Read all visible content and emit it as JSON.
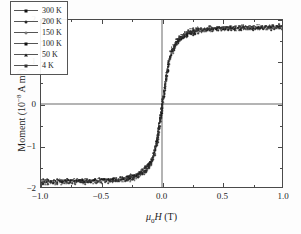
{
  "chart_data": {
    "type": "scatter",
    "title": "",
    "xlabel": "μ₀H (T)",
    "ylabel": "Moment (10⁻⁸ A m²)",
    "xlim": [
      -1.0,
      1.0
    ],
    "ylim": [
      -2.0,
      2.0
    ],
    "xticks": [
      "-1.0",
      "-0.5",
      "0.0",
      "0.5",
      "1.0"
    ],
    "xtick_values": [
      -1.0,
      -0.5,
      0.0,
      0.5,
      1.0
    ],
    "yticks": [
      "2",
      "1",
      "0",
      "-1",
      "-2"
    ],
    "ytick_values": [
      2,
      1,
      0,
      -1,
      -2
    ],
    "grid": false,
    "zero_lines": true,
    "legend_position": "upper-left",
    "x": [
      -1.0,
      -0.95,
      -0.9,
      -0.85,
      -0.8,
      -0.75,
      -0.7,
      -0.65,
      -0.6,
      -0.55,
      -0.5,
      -0.45,
      -0.4,
      -0.35,
      -0.3,
      -0.27,
      -0.24,
      -0.21,
      -0.18,
      -0.15,
      -0.13,
      -0.11,
      -0.09,
      -0.07,
      -0.05,
      -0.04,
      -0.03,
      -0.02,
      -0.01,
      0.0,
      0.01,
      0.02,
      0.03,
      0.04,
      0.05,
      0.07,
      0.09,
      0.11,
      0.13,
      0.15,
      0.18,
      0.21,
      0.24,
      0.27,
      0.3,
      0.35,
      0.4,
      0.45,
      0.5,
      0.55,
      0.6,
      0.65,
      0.7,
      0.75,
      0.8,
      0.85,
      0.9,
      0.95,
      1.0
    ],
    "series": [
      {
        "name": "300 K",
        "marker": "square",
        "color": "#111111",
        "values": [
          -1.8,
          -1.8,
          -1.8,
          -1.8,
          -1.8,
          -1.79,
          -1.79,
          -1.79,
          -1.78,
          -1.78,
          -1.77,
          -1.77,
          -1.76,
          -1.75,
          -1.73,
          -1.71,
          -1.69,
          -1.66,
          -1.61,
          -1.55,
          -1.49,
          -1.41,
          -1.31,
          -1.16,
          -0.92,
          -0.76,
          -0.58,
          -0.39,
          -0.2,
          0.0,
          0.2,
          0.39,
          0.58,
          0.76,
          0.92,
          1.16,
          1.31,
          1.41,
          1.49,
          1.55,
          1.61,
          1.66,
          1.69,
          1.71,
          1.73,
          1.75,
          1.76,
          1.77,
          1.77,
          1.78,
          1.78,
          1.79,
          1.79,
          1.79,
          1.8,
          1.8,
          1.8,
          1.8,
          1.8
        ]
      },
      {
        "name": "200 K",
        "marker": "circle",
        "color": "#2b2b2b",
        "values": [
          -1.81,
          -1.81,
          -1.81,
          -1.81,
          -1.8,
          -1.8,
          -1.8,
          -1.8,
          -1.79,
          -1.79,
          -1.78,
          -1.78,
          -1.77,
          -1.76,
          -1.74,
          -1.72,
          -1.7,
          -1.67,
          -1.62,
          -1.56,
          -1.5,
          -1.42,
          -1.32,
          -1.17,
          -0.93,
          -0.77,
          -0.59,
          -0.4,
          -0.2,
          0.0,
          0.2,
          0.4,
          0.59,
          0.77,
          0.93,
          1.17,
          1.32,
          1.42,
          1.5,
          1.56,
          1.62,
          1.67,
          1.7,
          1.72,
          1.74,
          1.76,
          1.77,
          1.78,
          1.78,
          1.79,
          1.79,
          1.8,
          1.8,
          1.8,
          1.81,
          1.81,
          1.81,
          1.81,
          1.81
        ]
      },
      {
        "name": "150 K",
        "marker": "open-circle",
        "color": "#555555",
        "values": [
          -1.82,
          -1.82,
          -1.82,
          -1.81,
          -1.81,
          -1.81,
          -1.81,
          -1.8,
          -1.8,
          -1.8,
          -1.79,
          -1.79,
          -1.78,
          -1.77,
          -1.75,
          -1.73,
          -1.71,
          -1.68,
          -1.63,
          -1.57,
          -1.51,
          -1.43,
          -1.33,
          -1.18,
          -0.94,
          -0.78,
          -0.6,
          -0.4,
          -0.2,
          0.0,
          0.2,
          0.4,
          0.6,
          0.78,
          0.94,
          1.18,
          1.33,
          1.43,
          1.51,
          1.57,
          1.63,
          1.68,
          1.71,
          1.73,
          1.75,
          1.77,
          1.78,
          1.79,
          1.79,
          1.8,
          1.8,
          1.81,
          1.81,
          1.81,
          1.81,
          1.82,
          1.82,
          1.82,
          1.82
        ]
      },
      {
        "name": "100 K",
        "marker": "diamond",
        "color": "#111111",
        "values": [
          -1.83,
          -1.83,
          -1.83,
          -1.82,
          -1.82,
          -1.82,
          -1.82,
          -1.81,
          -1.81,
          -1.81,
          -1.8,
          -1.8,
          -1.79,
          -1.78,
          -1.76,
          -1.74,
          -1.72,
          -1.69,
          -1.64,
          -1.58,
          -1.52,
          -1.44,
          -1.34,
          -1.19,
          -0.95,
          -0.79,
          -0.61,
          -0.41,
          -0.21,
          0.0,
          0.21,
          0.41,
          0.61,
          0.79,
          0.95,
          1.19,
          1.34,
          1.44,
          1.52,
          1.58,
          1.64,
          1.69,
          1.72,
          1.74,
          1.76,
          1.78,
          1.79,
          1.8,
          1.8,
          1.81,
          1.81,
          1.82,
          1.82,
          1.82,
          1.82,
          1.83,
          1.83,
          1.83,
          1.83
        ]
      },
      {
        "name": "50 K",
        "marker": "triangle",
        "color": "#222222",
        "values": [
          -1.85,
          -1.85,
          -1.84,
          -1.84,
          -1.84,
          -1.83,
          -1.83,
          -1.83,
          -1.82,
          -1.82,
          -1.81,
          -1.81,
          -1.8,
          -1.79,
          -1.77,
          -1.75,
          -1.73,
          -1.7,
          -1.65,
          -1.59,
          -1.53,
          -1.45,
          -1.35,
          -1.2,
          -0.96,
          -0.8,
          -0.62,
          -0.42,
          -0.21,
          0.0,
          0.21,
          0.42,
          0.62,
          0.8,
          0.96,
          1.2,
          1.35,
          1.45,
          1.53,
          1.59,
          1.65,
          1.7,
          1.73,
          1.75,
          1.77,
          1.79,
          1.8,
          1.81,
          1.81,
          1.82,
          1.82,
          1.83,
          1.83,
          1.83,
          1.84,
          1.84,
          1.84,
          1.85,
          1.85
        ]
      },
      {
        "name": "4 K",
        "marker": "star",
        "color": "#333333",
        "values": [
          -1.87,
          -1.87,
          -1.86,
          -1.86,
          -1.86,
          -1.85,
          -1.85,
          -1.85,
          -1.84,
          -1.84,
          -1.83,
          -1.83,
          -1.82,
          -1.81,
          -1.79,
          -1.77,
          -1.75,
          -1.72,
          -1.67,
          -1.61,
          -1.55,
          -1.47,
          -1.37,
          -1.22,
          -0.98,
          -0.82,
          -0.63,
          -0.43,
          -0.22,
          0.0,
          0.22,
          0.43,
          0.63,
          0.82,
          0.98,
          1.22,
          1.37,
          1.47,
          1.55,
          1.61,
          1.67,
          1.72,
          1.75,
          1.77,
          1.79,
          1.81,
          1.82,
          1.83,
          1.83,
          1.84,
          1.84,
          1.85,
          1.85,
          1.85,
          1.86,
          1.86,
          1.86,
          1.87,
          1.87
        ]
      }
    ]
  },
  "axes": {
    "x_title_prefix": "μ",
    "x_title_sub": "0",
    "x_title_var": "H",
    "x_title_unit": " (T)",
    "y_title_main": "Moment (10",
    "y_title_exp": "−8",
    "y_title_tail": " A m",
    "y_title_exp2": "2",
    "y_title_close": ")"
  },
  "legend": {
    "entries": [
      {
        "label": "300 K",
        "marker": "square"
      },
      {
        "label": "200 K",
        "marker": "circle"
      },
      {
        "label": "150 K",
        "marker": "open-circle"
      },
      {
        "label": "100 K",
        "marker": "diamond"
      },
      {
        "label": "50 K",
        "marker": "triangle"
      },
      {
        "label": "4 K",
        "marker": "star"
      }
    ]
  }
}
